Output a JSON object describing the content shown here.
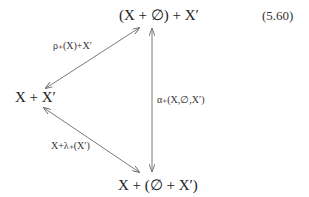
{
  "equation_number": "(5.60)",
  "nodes": {
    "top": "(X + ∅) + X′",
    "left": "X + X′",
    "bottom": "X + (∅ + X′)"
  },
  "arrows": {
    "top_left": {
      "label": "ρ₊(X)+X′",
      "from": "left",
      "to": "top",
      "bidirectional": true
    },
    "vertical": {
      "label": "α₊(X,∅,X′)",
      "from": "top",
      "to": "bottom",
      "bidirectional": true
    },
    "left_bottom": {
      "label": "X+λ₊(X′)",
      "from": "left",
      "to": "bottom",
      "bidirectional": true
    }
  },
  "colors": {
    "line": "#6b6b6b",
    "text": "#222222"
  }
}
